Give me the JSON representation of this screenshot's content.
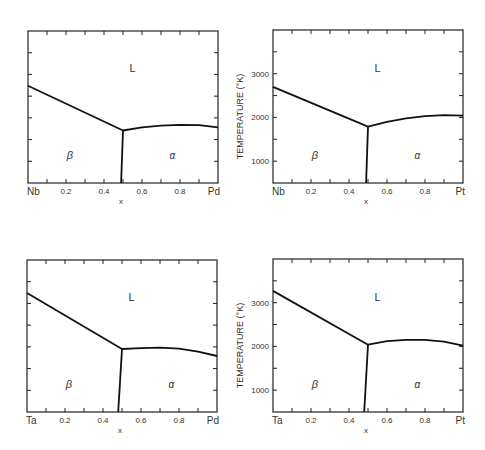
{
  "figure": {
    "ylabel": "TEMPERATURE (°K)",
    "xlabel": "x"
  },
  "chart_data": [
    {
      "type": "line",
      "title": "Nb–Pd phase diagram",
      "xlabel": "x",
      "ylabel": "",
      "x_left_label": "Nb",
      "x_right_label": "Pd",
      "x_tick_labels": [
        "0.2",
        "0.4",
        "0.6",
        "0.8"
      ],
      "y_tick_labels": [],
      "xlim": [
        0,
        1
      ],
      "ylim": [
        500,
        4000
      ],
      "regions": [
        "L",
        "β",
        "α"
      ],
      "series": [
        {
          "name": "liquidus-beta",
          "x": [
            0,
            0.5
          ],
          "y": [
            2740,
            1710
          ]
        },
        {
          "name": "liquidus-alpha",
          "x": [
            0.5,
            0.6,
            0.7,
            0.8,
            0.9,
            1.0
          ],
          "y": [
            1710,
            1780,
            1820,
            1840,
            1830,
            1780
          ]
        },
        {
          "name": "beta-alpha-boundary",
          "x": [
            0.5,
            0.49
          ],
          "y": [
            1710,
            500
          ]
        }
      ]
    },
    {
      "type": "line",
      "title": "Nb–Pt phase diagram",
      "xlabel": "x",
      "ylabel": "TEMPERATURE (°K)",
      "x_left_label": "Nb",
      "x_right_label": "Pt",
      "x_tick_labels": [
        "0.2",
        "0.4",
        "0.6",
        "0.8"
      ],
      "y_tick_labels": [
        "1000",
        "2000",
        "3000"
      ],
      "xlim": [
        0,
        1
      ],
      "ylim": [
        500,
        4000
      ],
      "regions": [
        "L",
        "β",
        "α"
      ],
      "series": [
        {
          "name": "liquidus-beta",
          "x": [
            0,
            0.5
          ],
          "y": [
            2700,
            1790
          ]
        },
        {
          "name": "liquidus-alpha",
          "x": [
            0.5,
            0.6,
            0.7,
            0.8,
            0.9,
            1.0
          ],
          "y": [
            1790,
            1900,
            1980,
            2030,
            2050,
            2040
          ]
        },
        {
          "name": "beta-alpha-boundary",
          "x": [
            0.5,
            0.49
          ],
          "y": [
            1790,
            500
          ]
        }
      ]
    },
    {
      "type": "line",
      "title": "Ta–Pd phase diagram",
      "xlabel": "x",
      "ylabel": "",
      "x_left_label": "Ta",
      "x_right_label": "Pd",
      "x_tick_labels": [
        "0.2",
        "0.4",
        "0.6",
        "0.8"
      ],
      "y_tick_labels": [],
      "xlim": [
        0,
        1
      ],
      "ylim": [
        500,
        4000
      ],
      "regions": [
        "L",
        "β",
        "α"
      ],
      "series": [
        {
          "name": "liquidus-beta",
          "x": [
            0,
            0.5
          ],
          "y": [
            3240,
            1950
          ]
        },
        {
          "name": "liquidus-alpha",
          "x": [
            0.5,
            0.6,
            0.7,
            0.8,
            0.9,
            1.0
          ],
          "y": [
            1950,
            1970,
            1980,
            1960,
            1890,
            1790
          ]
        },
        {
          "name": "beta-alpha-boundary",
          "x": [
            0.5,
            0.48
          ],
          "y": [
            1950,
            500
          ]
        }
      ]
    },
    {
      "type": "line",
      "title": "Ta–Pt phase diagram",
      "xlabel": "x",
      "ylabel": "TEMPERATURE (°K)",
      "x_left_label": "Ta",
      "x_right_label": "Pt",
      "x_tick_labels": [
        "0.2",
        "0.4",
        "0.6",
        "0.8"
      ],
      "y_tick_labels": [
        "1000",
        "2000",
        "3000"
      ],
      "xlim": [
        0,
        1
      ],
      "ylim": [
        500,
        4000
      ],
      "regions": [
        "L",
        "β",
        "α"
      ],
      "series": [
        {
          "name": "liquidus-beta",
          "x": [
            0,
            0.5
          ],
          "y": [
            3270,
            2040
          ]
        },
        {
          "name": "liquidus-alpha",
          "x": [
            0.5,
            0.6,
            0.7,
            0.8,
            0.9,
            1.0
          ],
          "y": [
            2040,
            2120,
            2150,
            2150,
            2110,
            2020
          ]
        },
        {
          "name": "beta-alpha-boundary",
          "x": [
            0.5,
            0.48
          ],
          "y": [
            2040,
            500
          ]
        }
      ]
    }
  ]
}
